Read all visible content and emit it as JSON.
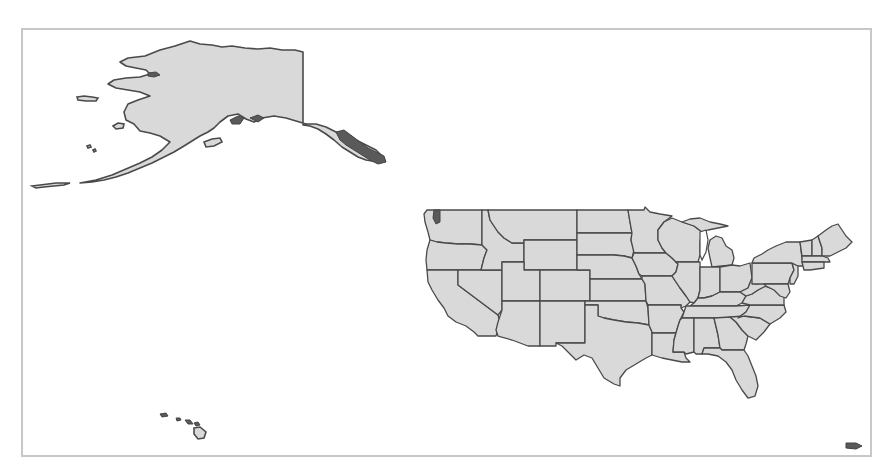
{
  "map": {
    "title": "United States map",
    "fill_color": "#d9d9d9",
    "border_color": "#4a4a4a",
    "frame_color": "#c8c8c8",
    "regions": [
      {
        "id": "alaska",
        "label": "Alaska"
      },
      {
        "id": "hawaii",
        "label": "Hawaii"
      },
      {
        "id": "contiguous-us",
        "label": "Contiguous United States"
      },
      {
        "id": "puerto-rico",
        "label": "Puerto Rico"
      }
    ]
  }
}
